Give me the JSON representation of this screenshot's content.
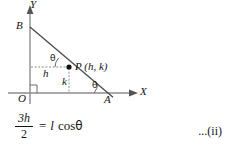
{
  "figure": {
    "axes": {
      "x_axis_label": "X",
      "y_axis_label": "Y"
    },
    "points": [
      {
        "name": "origin",
        "label": "O"
      },
      {
        "name": "point-b",
        "label": "B"
      },
      {
        "name": "point-a",
        "label": "A"
      },
      {
        "name": "point-p",
        "label": "P (h, k)"
      }
    ],
    "segment_labels": {
      "horizontal_dashed": "h",
      "vertical_dashed": "k"
    },
    "angles": {
      "upper_theta": "θ",
      "lower_theta": "θ"
    },
    "right_angle_marker": "right-angle-at-origin",
    "colors": {
      "axis": "#8c8c8c",
      "line": "#4a4a4a",
      "dashed": "#8c8c8c",
      "text": "#141414",
      "point_fill": "#111111",
      "background": "#ffffff"
    }
  },
  "equation": {
    "numerator": "3h",
    "denominator": "2",
    "equals": "=",
    "rhs_l": "l",
    "rhs_cos": "cos",
    "rhs_theta": "θ",
    "reference": "...(ii)"
  }
}
